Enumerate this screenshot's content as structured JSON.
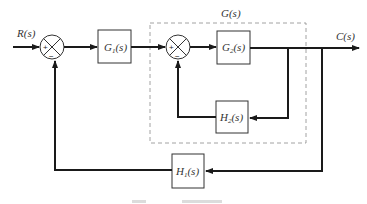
{
  "diagram": {
    "signals": {
      "input": "R(s)",
      "output": "C(s)"
    },
    "group_label": "G(s)",
    "blocks": [
      {
        "id": "G1",
        "label": "G",
        "sub": "1",
        "suffix": "(s)"
      },
      {
        "id": "G2",
        "label": "G",
        "sub": "2",
        "suffix": "(s)"
      },
      {
        "id": "H2",
        "label": "H",
        "sub": "2",
        "suffix": "(s)"
      },
      {
        "id": "H1",
        "label": "H",
        "sub": "1",
        "suffix": "(s)"
      }
    ],
    "summing_junctions": [
      {
        "id": "S1",
        "plus": "+",
        "minus": "−"
      },
      {
        "id": "S2",
        "plus": "+",
        "minus": "−"
      }
    ],
    "connections": [
      "R(s) → S1(+)",
      "S1 → G1",
      "G1 → S2(+)",
      "S2 → G2",
      "G2 → C(s)",
      "C(s) → H2 → S2(−)",
      "C(s) → H1 → S1(−)"
    ]
  }
}
